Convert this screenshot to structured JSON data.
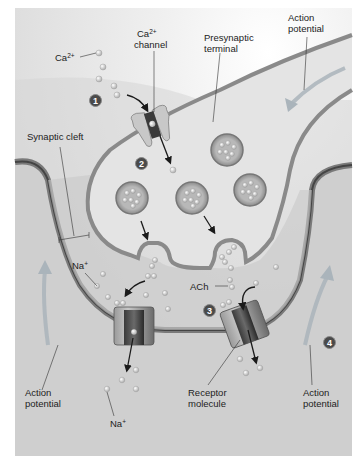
{
  "diagram": {
    "colors": {
      "background": "#d4d4d4",
      "frame": "#ffffff",
      "presynaptic_fill": "#e2e2e2",
      "membrane_outer": "#7c7c7c",
      "membrane_inner": "#4a4a4a",
      "arrow": "#1a1a1a",
      "ap_arrow": "#a8b4bc"
    },
    "labels": {
      "ca_ion": "Ca",
      "ca_ion_sup": "2+",
      "ca_channel_line1": "Ca",
      "ca_channel_sup": "2+",
      "ca_channel_line2": "channel",
      "presynaptic_line1": "Presynaptic",
      "presynaptic_line2": "terminal",
      "ap_top_line1": "Action",
      "ap_top_line2": "potential",
      "synaptic_cleft": "Synaptic cleft",
      "na_upper": "Na",
      "na_upper_sup": "+",
      "ach": "ACh",
      "ap_left_line1": "Action",
      "ap_left_line2": "potential",
      "na_lower": "Na",
      "na_lower_sup": "+",
      "receptor_line1": "Receptor",
      "receptor_line2": "molecule",
      "ap_right_line1": "Action",
      "ap_right_line2": "potential"
    },
    "steps": [
      {
        "number": "1"
      },
      {
        "number": "2"
      },
      {
        "number": "3"
      },
      {
        "number": "4"
      }
    ]
  }
}
